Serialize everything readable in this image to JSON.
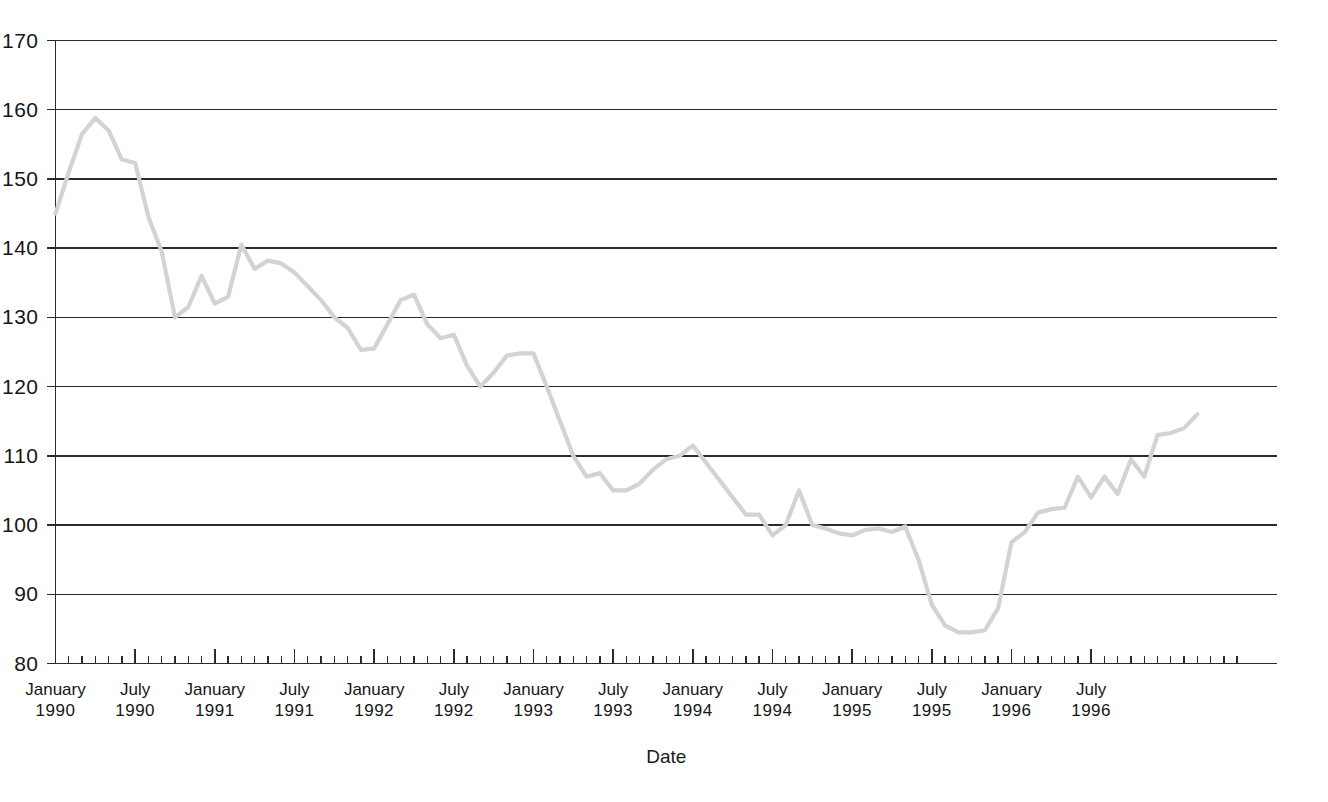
{
  "chart_data": {
    "type": "line",
    "title": "",
    "xlabel": "Date",
    "ylabel": "",
    "ylim": [
      80,
      170
    ],
    "ytick_labels": [
      "170",
      "160",
      "150",
      "140",
      "130",
      "120",
      "110",
      "100",
      "90",
      "80"
    ],
    "ytick_values": [
      170,
      160,
      150,
      140,
      130,
      120,
      110,
      100,
      90,
      80
    ],
    "grid": "horizontal",
    "legend": "none",
    "line_color": "#d3d3d3",
    "axis_color": "#2b2b2b",
    "x_major_labels": [
      {
        "month": "January",
        "year": "1990",
        "index": 0
      },
      {
        "month": "July",
        "year": "1990",
        "index": 6
      },
      {
        "month": "January",
        "year": "1991",
        "index": 12
      },
      {
        "month": "July",
        "year": "1991",
        "index": 18
      },
      {
        "month": "January",
        "year": "1992",
        "index": 24
      },
      {
        "month": "July",
        "year": "1992",
        "index": 30
      },
      {
        "month": "January",
        "year": "1993",
        "index": 36
      },
      {
        "month": "July",
        "year": "1993",
        "index": 42
      },
      {
        "month": "January",
        "year": "1994",
        "index": 48
      },
      {
        "month": "July",
        "year": "1994",
        "index": 54
      },
      {
        "month": "January",
        "year": "1995",
        "index": 60
      },
      {
        "month": "July",
        "year": "1995",
        "index": 66
      },
      {
        "month": "January",
        "year": "1996",
        "index": 72
      },
      {
        "month": "July",
        "year": "1996",
        "index": 78
      }
    ],
    "x": [
      "1990-01",
      "1990-02",
      "1990-03",
      "1990-04",
      "1990-05",
      "1990-06",
      "1990-07",
      "1990-08",
      "1990-09",
      "1990-10",
      "1990-11",
      "1990-12",
      "1991-01",
      "1991-02",
      "1991-03",
      "1991-04",
      "1991-05",
      "1991-06",
      "1991-07",
      "1991-08",
      "1991-09",
      "1991-10",
      "1991-11",
      "1991-12",
      "1992-01",
      "1992-02",
      "1992-03",
      "1992-04",
      "1992-05",
      "1992-06",
      "1992-07",
      "1992-08",
      "1992-09",
      "1992-10",
      "1992-11",
      "1992-12",
      "1993-01",
      "1993-02",
      "1993-03",
      "1993-04",
      "1993-05",
      "1993-06",
      "1993-07",
      "1993-08",
      "1993-09",
      "1993-10",
      "1993-11",
      "1993-12",
      "1994-01",
      "1994-02",
      "1994-03",
      "1994-04",
      "1994-05",
      "1994-06",
      "1994-07",
      "1994-08",
      "1994-09",
      "1994-10",
      "1994-11",
      "1994-12",
      "1995-01",
      "1995-02",
      "1995-03",
      "1995-04",
      "1995-05",
      "1995-06",
      "1995-07",
      "1995-08",
      "1995-09",
      "1995-10",
      "1995-11",
      "1995-12",
      "1996-01",
      "1996-02",
      "1996-03",
      "1996-04",
      "1996-05",
      "1996-06",
      "1996-07",
      "1996-08",
      "1996-09",
      "1996-10",
      "1996-11",
      "1996-12"
    ],
    "values": [
      145.0,
      151.0,
      156.5,
      158.8,
      157.0,
      152.8,
      152.3,
      144.5,
      139.5,
      130.0,
      131.5,
      136.0,
      132.0,
      133.0,
      140.5,
      137.0,
      138.2,
      137.8,
      136.5,
      134.5,
      132.5,
      130.0,
      128.5,
      125.3,
      125.5,
      129.0,
      132.5,
      133.3,
      129.0,
      127.0,
      127.5,
      123.0,
      120.0,
      122.0,
      124.5,
      124.8,
      124.8,
      120.0,
      115.0,
      110.0,
      107.0,
      107.5,
      105.0,
      105.0,
      106.0,
      108.0,
      109.5,
      110.0,
      111.5,
      109.0,
      106.5,
      104.0,
      101.5,
      101.5,
      98.5,
      100.0,
      105.0,
      100.0,
      99.5,
      98.8,
      98.5,
      99.3,
      99.5,
      99.0,
      99.8,
      95.0,
      88.5,
      85.5,
      84.5,
      84.5,
      84.8,
      88.0,
      97.5,
      99.0,
      101.8,
      102.3,
      102.5,
      107.0,
      104.0,
      107.0,
      104.5,
      109.5,
      107.0,
      113.0
    ],
    "series_extra": [
      113.3,
      114.0,
      116.0
    ]
  },
  "axis": {
    "x_title": "Date"
  }
}
